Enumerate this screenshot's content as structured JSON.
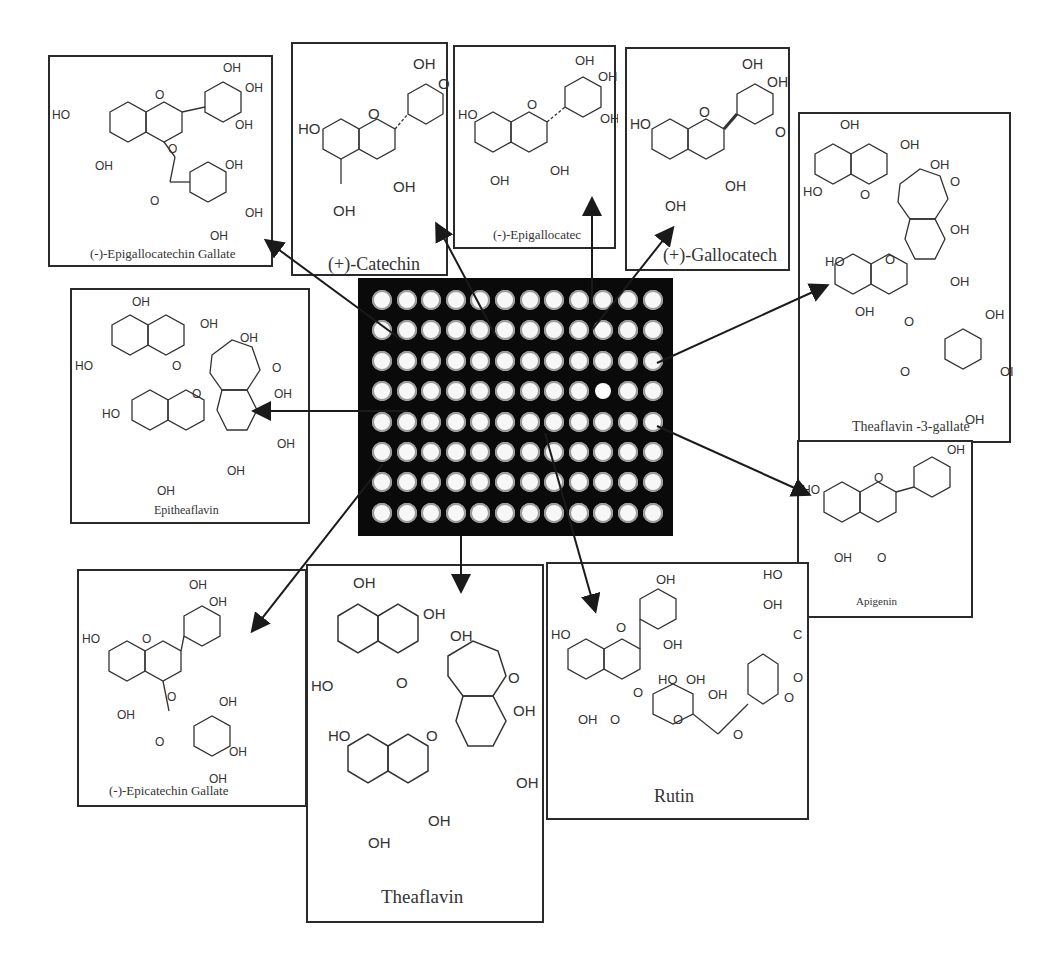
{
  "figure": {
    "plate": {
      "rows": 8,
      "columns": 12,
      "highlighted_well": {
        "row": 4,
        "column": 10
      }
    },
    "compounds": [
      {
        "id": "egcg",
        "name": "(-)-Epigallocatechin Gallate",
        "substituent_labels": [
          "OH",
          "OH",
          "OH",
          "HO",
          "OH",
          "O",
          "O",
          "OH",
          "OH",
          "OH"
        ]
      },
      {
        "id": "catechin",
        "name": "(+)-Catechin",
        "substituent_labels": [
          "OH",
          "O",
          "HO",
          "O",
          "OH",
          "OH"
        ]
      },
      {
        "id": "egc",
        "name": "(-)-Epigallocatec",
        "substituent_labels": [
          "OH",
          "OH",
          "HO",
          "O",
          "OH",
          "OH",
          "OH"
        ]
      },
      {
        "id": "gallocatechin",
        "name": "(+)-Gallocatech",
        "substituent_labels": [
          "OH",
          "OH",
          "HO",
          "O",
          "O",
          "OH",
          "OH"
        ]
      },
      {
        "id": "tf3g",
        "name": "Theaflavin -3-gallate",
        "substituent_labels": [
          "OH",
          "OH",
          "OH",
          "HO",
          "O",
          "O",
          "OH",
          "HO",
          "O",
          "OH",
          "OH",
          "OH",
          "O",
          "O",
          "OI",
          "OH"
        ]
      },
      {
        "id": "epitheaflavin",
        "name": "Epitheaflavin",
        "substituent_labels": [
          "OH",
          "OH",
          "OH",
          "HO",
          "O",
          "O",
          "OH",
          "HO",
          "O",
          "OH",
          "OH",
          "OH"
        ]
      },
      {
        "id": "apigenin",
        "name": "Apigenin",
        "substituent_labels": [
          "OH",
          "HO",
          "O",
          "OH",
          "O"
        ]
      },
      {
        "id": "ecg",
        "name": "(-)-Epicatechin Gallate",
        "substituent_labels": [
          "OH",
          "OH",
          "HO",
          "O",
          "OH",
          "O",
          "O",
          "OH",
          "OH",
          "OH"
        ]
      },
      {
        "id": "theaflavin",
        "name": "Theaflavin",
        "substituent_labels": [
          "OH",
          "OH",
          "OH",
          "HO",
          "O",
          "O",
          "OH",
          "HO",
          "O",
          "OH",
          "OH",
          "OH"
        ]
      },
      {
        "id": "rutin",
        "name": "Rutin",
        "substituent_labels": [
          "OH",
          "HO",
          "O",
          "OH",
          "HO",
          "OH",
          "OH",
          "OH",
          "O",
          "O",
          "O",
          "O",
          "O",
          "HO",
          "OH",
          "CH3",
          "O"
        ]
      }
    ],
    "colors": {
      "plate": "#0a0a0a",
      "well": "#f7f7f7",
      "well_rim": "#9a9a9a",
      "line": "#2a2a2a",
      "background": "#ffffff"
    }
  }
}
